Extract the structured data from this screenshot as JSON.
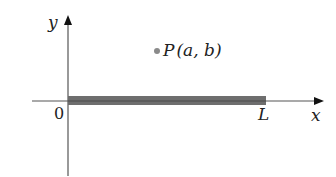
{
  "diagram": {
    "type": "coordinate-plane",
    "axes": {
      "x_label": "x",
      "y_label": "y",
      "origin_label": "0"
    },
    "segment": {
      "start_label": "0",
      "end_label": "L",
      "color": "#6e6e6e"
    },
    "point": {
      "name": "P",
      "coords": "(a, b)",
      "color": "#8a8a8a"
    },
    "colors": {
      "axis": "#555555",
      "text": "#222222"
    }
  }
}
